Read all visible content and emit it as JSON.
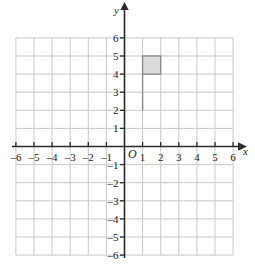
{
  "chart_data": {
    "type": "scatter",
    "title": "",
    "xlabel": "x",
    "ylabel": "y",
    "grid": true,
    "legend": null,
    "xlim": [
      -6,
      6
    ],
    "ylim": [
      -6,
      6
    ],
    "xticks": [
      -6,
      -5,
      -4,
      -3,
      -2,
      -1,
      1,
      2,
      3,
      4,
      5,
      6
    ],
    "yticks": [
      -6,
      -5,
      -4,
      -3,
      -2,
      -1,
      1,
      2,
      3,
      4,
      5,
      6
    ],
    "xtick_labels": [
      "-6",
      "-5",
      "-4",
      "-3",
      "-2",
      "-1",
      "1",
      "2",
      "3",
      "4",
      "5",
      "6"
    ],
    "ytick_labels": [
      "-6",
      "-5",
      "-4",
      "-3",
      "-2",
      "-1",
      "1",
      "2",
      "3",
      "4",
      "5",
      "6"
    ],
    "origin_label": "O",
    "shapes": [
      {
        "name": "shaded-square",
        "type": "rect",
        "x0": 1,
        "y0": 4,
        "x1": 2,
        "y1": 5,
        "fill": "#dcdcdc",
        "stroke": "#8c8c8c"
      },
      {
        "name": "vertical-segment",
        "type": "line",
        "x0": 1,
        "y0": 2,
        "x1": 1,
        "y1": 4,
        "stroke": "#8c8c8c"
      }
    ]
  },
  "axes": {
    "x_axis_name": "x",
    "y_axis_name": "y",
    "origin_label": "O",
    "x_labels": [
      {
        "value": -6,
        "text": "-6"
      },
      {
        "value": -5,
        "text": "-5"
      },
      {
        "value": -4,
        "text": "-4"
      },
      {
        "value": -3,
        "text": "-3"
      },
      {
        "value": -2,
        "text": "-2"
      },
      {
        "value": -1,
        "text": "-1"
      },
      {
        "value": 1,
        "text": "1"
      },
      {
        "value": 2,
        "text": "2"
      },
      {
        "value": 3,
        "text": "3"
      },
      {
        "value": 4,
        "text": "4"
      },
      {
        "value": 5,
        "text": "5"
      },
      {
        "value": 6,
        "text": "6"
      }
    ],
    "y_labels": [
      {
        "value": 6,
        "text": "6"
      },
      {
        "value": 5,
        "text": "5"
      },
      {
        "value": 4,
        "text": "4"
      },
      {
        "value": 3,
        "text": "3"
      },
      {
        "value": 2,
        "text": "2"
      },
      {
        "value": 1,
        "text": "1"
      },
      {
        "value": -1,
        "text": "-1"
      },
      {
        "value": -2,
        "text": "-2"
      },
      {
        "value": -3,
        "text": "-3"
      },
      {
        "value": -4,
        "text": "-4"
      },
      {
        "value": -5,
        "text": "-5"
      },
      {
        "value": -6,
        "text": "-6"
      }
    ]
  },
  "colors": {
    "grid": "#c9c9c9",
    "axis": "#2b2b2b",
    "shape_fill": "#dcdcdc",
    "shape_stroke": "#8c8c8c",
    "background": "#ffffff"
  }
}
